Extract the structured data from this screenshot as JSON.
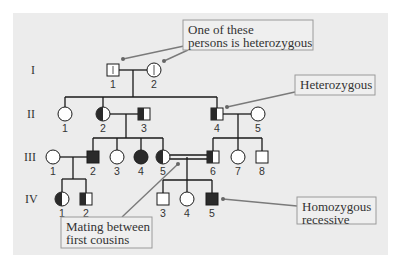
{
  "diagram": {
    "type": "pedigree",
    "panel": {
      "x": 13,
      "y": 13,
      "w": 375,
      "h": 242,
      "fill": "#ececec"
    },
    "colors": {
      "line": "#1a1a1a",
      "affected": "#2a2a2a",
      "unaffected": "#ffffff",
      "callout_border": "#9a9a9a",
      "callout_fill": "#efefef",
      "pointer": "#7a7a7a"
    },
    "generations": [
      {
        "label": "I",
        "x": 31,
        "y": 74
      },
      {
        "label": "II",
        "x": 27,
        "y": 118
      },
      {
        "label": "III",
        "x": 24,
        "y": 161
      },
      {
        "label": "IV",
        "x": 25,
        "y": 203
      }
    ],
    "individuals": [
      {
        "id": "I-1",
        "num": "1",
        "sex": "male",
        "status": "carrier-mark",
        "cx": 113,
        "cy": 70
      },
      {
        "id": "I-2",
        "num": "2",
        "sex": "female",
        "status": "carrier-mark",
        "cx": 154,
        "cy": 70
      },
      {
        "id": "II-1",
        "num": "1",
        "sex": "female",
        "status": "unaffected",
        "cx": 65,
        "cy": 114
      },
      {
        "id": "II-2",
        "num": "2",
        "sex": "female",
        "status": "heterozygous",
        "cx": 103,
        "cy": 114
      },
      {
        "id": "II-3",
        "num": "3",
        "sex": "male",
        "status": "heterozygous",
        "cx": 144,
        "cy": 114
      },
      {
        "id": "II-4",
        "num": "4",
        "sex": "male",
        "status": "heterozygous",
        "cx": 217,
        "cy": 114
      },
      {
        "id": "II-5",
        "num": "5",
        "sex": "female",
        "status": "unaffected",
        "cx": 258,
        "cy": 114
      },
      {
        "id": "III-1",
        "num": "1",
        "sex": "female",
        "status": "unaffected",
        "cx": 53,
        "cy": 157
      },
      {
        "id": "III-2",
        "num": "2",
        "sex": "male",
        "status": "affected",
        "cx": 93,
        "cy": 157
      },
      {
        "id": "III-3",
        "num": "3",
        "sex": "female",
        "status": "unaffected",
        "cx": 117,
        "cy": 157
      },
      {
        "id": "III-4",
        "num": "4",
        "sex": "female",
        "status": "affected",
        "cx": 141,
        "cy": 157
      },
      {
        "id": "III-5",
        "num": "5",
        "sex": "female",
        "status": "heterozygous",
        "cx": 163,
        "cy": 157
      },
      {
        "id": "III-6",
        "num": "6",
        "sex": "male",
        "status": "heterozygous",
        "cx": 213,
        "cy": 157
      },
      {
        "id": "III-7",
        "num": "7",
        "sex": "female",
        "status": "unaffected",
        "cx": 238,
        "cy": 157
      },
      {
        "id": "III-8",
        "num": "8",
        "sex": "male",
        "status": "unaffected",
        "cx": 262,
        "cy": 157
      },
      {
        "id": "IV-1",
        "num": "1",
        "sex": "female",
        "status": "heterozygous",
        "cx": 62,
        "cy": 199
      },
      {
        "id": "IV-2",
        "num": "2",
        "sex": "male",
        "status": "heterozygous",
        "cx": 86,
        "cy": 199
      },
      {
        "id": "IV-3",
        "num": "3",
        "sex": "male",
        "status": "unaffected",
        "cx": 163,
        "cy": 199
      },
      {
        "id": "IV-4",
        "num": "4",
        "sex": "female",
        "status": "unaffected",
        "cx": 187,
        "cy": 199
      },
      {
        "id": "IV-5",
        "num": "5",
        "sex": "male",
        "status": "affected",
        "cx": 212,
        "cy": 199
      }
    ],
    "lines": [
      {
        "name": "mating-line-I1-I2",
        "pts": [
          119,
          70,
          147,
          70
        ]
      },
      {
        "name": "descent-line-I",
        "pts": [
          133,
          70,
          133,
          97
        ]
      },
      {
        "name": "sibship-line-II",
        "pts": [
          65,
          97,
          217,
          97
        ]
      },
      {
        "name": "drop-II1",
        "pts": [
          65,
          97,
          65,
          107
        ]
      },
      {
        "name": "drop-II2",
        "pts": [
          103,
          97,
          103,
          107
        ]
      },
      {
        "name": "drop-II4",
        "pts": [
          217,
          97,
          217,
          108
        ]
      },
      {
        "name": "mating-line-II2-II3",
        "pts": [
          110,
          114,
          138,
          114
        ]
      },
      {
        "name": "descent-line-II2-II3",
        "pts": [
          126,
          114,
          126,
          138
        ]
      },
      {
        "name": "sibship-line-III-left",
        "pts": [
          93,
          138,
          163,
          138
        ]
      },
      {
        "name": "drop-III2",
        "pts": [
          93,
          138,
          93,
          151
        ]
      },
      {
        "name": "drop-III3",
        "pts": [
          117,
          138,
          117,
          150
        ]
      },
      {
        "name": "drop-III4",
        "pts": [
          141,
          138,
          141,
          150
        ]
      },
      {
        "name": "drop-III5",
        "pts": [
          163,
          138,
          163,
          150
        ]
      },
      {
        "name": "mating-line-II4-II5",
        "pts": [
          223,
          114,
          251,
          114
        ]
      },
      {
        "name": "descent-line-II4-II5",
        "pts": [
          238,
          114,
          238,
          138
        ]
      },
      {
        "name": "sibship-line-III-right",
        "pts": [
          213,
          138,
          262,
          138
        ]
      },
      {
        "name": "drop-III6",
        "pts": [
          213,
          138,
          213,
          151
        ]
      },
      {
        "name": "drop-III7",
        "pts": [
          238,
          138,
          238,
          150
        ]
      },
      {
        "name": "drop-III8",
        "pts": [
          262,
          138,
          262,
          151
        ]
      },
      {
        "name": "mating-line-III1-III2",
        "pts": [
          60,
          157,
          87,
          157
        ]
      },
      {
        "name": "descent-line-III1-III2",
        "pts": [
          73,
          157,
          73,
          179
        ]
      },
      {
        "name": "sibship-line-IV-left",
        "pts": [
          62,
          179,
          86,
          179
        ]
      },
      {
        "name": "drop-IV1",
        "pts": [
          62,
          179,
          62,
          192
        ]
      },
      {
        "name": "drop-IV2",
        "pts": [
          86,
          179,
          86,
          193
        ]
      },
      {
        "name": "consanguineous-line-top",
        "pts": [
          170,
          155,
          207,
          155
        ]
      },
      {
        "name": "consanguineous-line-bottom",
        "pts": [
          170,
          159,
          207,
          159
        ]
      },
      {
        "name": "descent-line-III5-III6",
        "pts": [
          187,
          157,
          187,
          180
        ]
      },
      {
        "name": "sibship-line-IV-right",
        "pts": [
          163,
          180,
          212,
          180
        ]
      },
      {
        "name": "drop-IV3",
        "pts": [
          163,
          180,
          163,
          193
        ]
      },
      {
        "name": "drop-IV4",
        "pts": [
          187,
          180,
          187,
          192
        ]
      },
      {
        "name": "drop-IV5",
        "pts": [
          212,
          180,
          212,
          193
        ]
      }
    ],
    "callouts": [
      {
        "name": "callout-one-heterozygous",
        "x": 183,
        "y": 20,
        "w": 130,
        "h": 30,
        "lines": [
          "One of these",
          "persons is heterozygous"
        ],
        "pointers": [
          [
            123,
            59,
            184,
            46
          ],
          [
            164,
            61,
            188,
            50
          ]
        ]
      },
      {
        "name": "callout-heterozygous",
        "x": 295,
        "y": 75,
        "w": 80,
        "h": 20,
        "lines": [
          "Heterozygous"
        ],
        "pointers": [
          [
            227,
            107,
            295,
            92
          ]
        ]
      },
      {
        "name": "callout-mating-first-cousins",
        "x": 61,
        "y": 217,
        "w": 91,
        "h": 31,
        "lines": [
          "Mating between",
          "first cousins"
        ],
        "pointers": [
          [
            178,
            164,
            122,
            217
          ]
        ]
      },
      {
        "name": "callout-homozygous-recessive",
        "x": 297,
        "y": 197,
        "w": 79,
        "h": 27,
        "lines": [
          "Homozygous",
          "recessive"
        ],
        "pointers": [
          [
            223,
            199,
            297,
            206
          ]
        ]
      }
    ]
  }
}
